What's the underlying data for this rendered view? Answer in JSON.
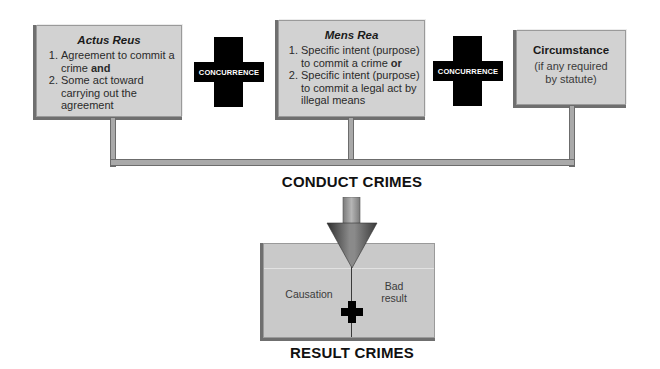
{
  "diagram": {
    "elements": {
      "actus_reus": {
        "title": "Actus Reus",
        "items": [
          {
            "number": "1.",
            "text": "Agreement to commit a crime",
            "emphasis": "and"
          },
          {
            "number": "2.",
            "text": "Some act toward carrying out the agreement"
          }
        ]
      },
      "concurrence_1": {
        "label": "CONCURRENCE"
      },
      "mens_rea": {
        "title": "Mens Rea",
        "items": [
          {
            "number": "1.",
            "text": "Specific intent (purpose) to commit a crime",
            "emphasis": "or"
          },
          {
            "number": "2.",
            "text": "Specific intent (purpose) to commit a legal act by illegal means"
          }
        ]
      },
      "concurrence_2": {
        "label": "CONCURRENCE"
      },
      "circumstance": {
        "title": "Circumstance",
        "subtitle": "(if any required by statute)"
      }
    },
    "conduct_label": "CONDUCT CRIMES",
    "result_box": {
      "left": "Causation",
      "right": "Bad result",
      "connector": "plus-icon"
    },
    "result_label": "RESULT CRIMES",
    "colors": {
      "box_fill": "#d2d2d2",
      "box_shadow": "#6f6f6f",
      "cross": "#000000",
      "pipe": "#a9a9a9",
      "arrow_dark": "#3c3c3c",
      "arrow_light": "#9a9a9a"
    }
  }
}
